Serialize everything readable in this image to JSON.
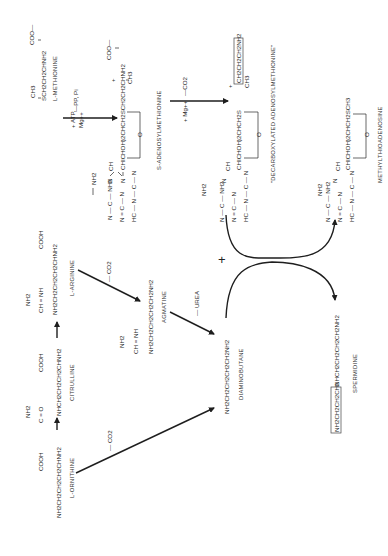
{
  "diagram": {
    "orientation": "rotated -90deg",
    "compounds": {
      "l_methionine": {
        "label": "L-METHIONINE",
        "top_left": "CH3",
        "top_right": "COO—",
        "main": "SCH2CH2CHNH2"
      },
      "sam": {
        "label": "S-ADENOSYLMETHIONINE",
        "coo": "COO—",
        "main": "CHICHOH)2CHCH2SCH2CH2CHNH2",
        "ch3": "CH3",
        "plus": "+",
        "ring_o": "O"
      },
      "dcsam": {
        "label": "\"DECARBOXYLATED ADENOSYLMETHIONINE\"",
        "main": "CHICHOH)2CHCH2S",
        "boxed": "CH2CH2CH2NH2",
        "ch3": "CH3",
        "plus": "+",
        "ring_o": "O"
      },
      "mta": {
        "label": "METHYLTHIOADENOSINE",
        "main": "CHICHOH)2CHCH2SCH3",
        "ring_o": "O"
      },
      "l_ornithine": {
        "label": "L-ORNITHINE",
        "main": "NH2CH2CH2CH2CHNH2",
        "cooh": "COOH"
      },
      "citrulline": {
        "label": "CITRULLINE",
        "main": "NHCH2CH2CH2CHNH2",
        "cooh": "COOH",
        "co": "C = O",
        "nh2": "NH2"
      },
      "l_arginine": {
        "label": "L-ARGININE",
        "main": "NH2CH2CH2CH2CHNH2",
        "cooh": "COOH",
        "chnh": "CH = NH",
        "nh2": "NH2"
      },
      "agmatine": {
        "label": "AGMATINE",
        "main": "NH2CH2CH2CH2CH2NH2",
        "chnh": "CH = NH",
        "nh2": "NH2"
      },
      "diaminobutane": {
        "label": "DIAMINOBUTANE",
        "main": "NH2CH2CH2CH2CH2NH2"
      },
      "spermidine": {
        "label": "SPERMIDINE",
        "boxed": "NH2CH2CH2CH2",
        "main": "NHCH2CH2CH2CH2NH2"
      }
    },
    "adenine": {
      "nh2": "NH2",
      "row1": "N — C — NH2",
      "n": "N",
      "c": "C",
      "hc": "HC",
      "ch": "CH"
    },
    "reaction_labels": {
      "atp": "+ ATP,",
      "mg": "Mg++",
      "ppi": "—PP, Pi",
      "mg2": "+ Mg++",
      "co2_sam": "—CO2",
      "co2_arg": "— CO2",
      "co2_orn": "— CO2",
      "urea": "— UREA",
      "plus": "+"
    }
  }
}
